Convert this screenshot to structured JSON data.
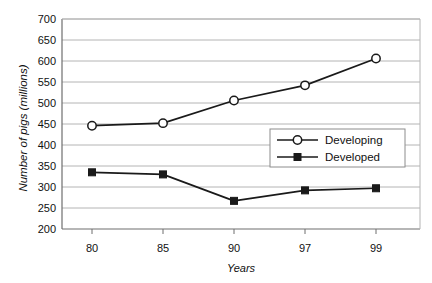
{
  "chart_data": {
    "type": "line",
    "title": "",
    "xlabel": "Years",
    "ylabel": "Number of pigs (millions)",
    "categories": [
      "80",
      "85",
      "90",
      "97",
      "99"
    ],
    "ylim": [
      200,
      700
    ],
    "yticks": [
      200,
      250,
      300,
      350,
      400,
      450,
      500,
      550,
      600,
      650,
      700
    ],
    "grid": "horizontal",
    "legend_position": "center-right-inside",
    "series": [
      {
        "name": "Developing",
        "marker": "open-circle",
        "color": "#1a1a1a",
        "values": [
          446,
          452,
          506,
          542,
          606
        ]
      },
      {
        "name": "Developed",
        "marker": "filled-square",
        "color": "#1a1a1a",
        "values": [
          335,
          330,
          267,
          292,
          297
        ]
      }
    ]
  },
  "axes": {
    "y_tick_labels": [
      "700",
      "650",
      "600",
      "550",
      "500",
      "450",
      "400",
      "350",
      "300",
      "250",
      "200"
    ],
    "x_tick_labels": [
      "80",
      "85",
      "90",
      "97",
      "99"
    ],
    "y_title": "Number of pigs (millions)",
    "x_title": "Years"
  },
  "legend": {
    "entries": [
      {
        "label": "Developing",
        "marker": "open-circle"
      },
      {
        "label": "Developed",
        "marker": "filled-square"
      }
    ]
  },
  "colors": {
    "line": "#1a1a1a",
    "grid": "#b4b4b4",
    "border": "#9a9a9a",
    "background": "#ffffff",
    "text": "#111111"
  }
}
